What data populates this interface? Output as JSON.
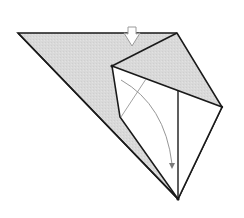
{
  "diagram": {
    "type": "origami-fold-step",
    "colors": {
      "paper_colored": "#d8d8d8",
      "paper_white": "#ffffff",
      "edge": "#1a1a1a",
      "guide": "#8a8a8a",
      "arrow_outline": "#9a9a9a",
      "arrow_fill": "#ffffff"
    },
    "vertices": {
      "left_corner": [
        18,
        33
      ],
      "top_right_corner": [
        177,
        33
      ],
      "right_corner": [
        222,
        107
      ],
      "bottom_point": [
        178,
        199
      ],
      "inner_top_left": [
        112,
        66
      ],
      "inner_bend": [
        120,
        117
      ],
      "center_line_top": [
        178,
        90
      ]
    },
    "symbols": [
      {
        "name": "push-arrow",
        "kind": "hollow-push-arrow",
        "position": [
          132,
          36
        ],
        "direction": "down"
      },
      {
        "name": "fold-arrow",
        "kind": "curved-move-arrow",
        "from": [
          121,
          80
        ],
        "to": [
          172,
          168
        ]
      },
      {
        "name": "crease-line",
        "kind": "thin-line",
        "from": [
          146,
          79
        ],
        "to": [
          121,
          117
        ]
      }
    ]
  }
}
